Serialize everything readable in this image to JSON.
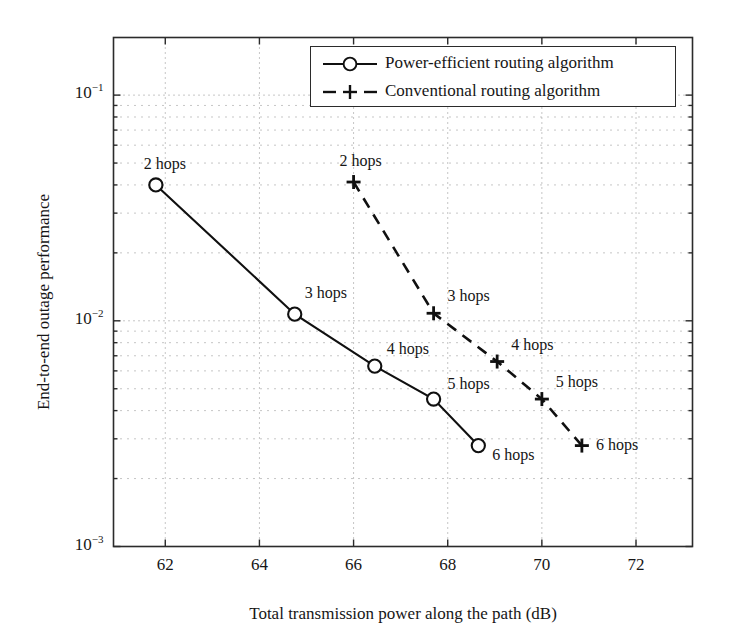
{
  "chart_data": {
    "type": "line",
    "title": "",
    "xlabel": "Total transmission power along the path (dB)",
    "ylabel": "End-to-end outage performance",
    "xlim": [
      60.9,
      73.2
    ],
    "ylim": [
      0.001,
      0.18
    ],
    "yscale": "log",
    "xticks": [
      62,
      64,
      66,
      68,
      70,
      72
    ],
    "xticklabels": [
      "62",
      "64",
      "66",
      "68",
      "70",
      "72"
    ],
    "yticks": [
      0.001,
      0.01,
      0.1
    ],
    "yticklabels": [
      "10-3",
      "10-2",
      "10-1"
    ],
    "grid": "dotted-minor-and-major",
    "legend_position": "upper right",
    "series": [
      {
        "name": "Power-efficient routing algorithm",
        "marker": "circle",
        "linestyle": "solid",
        "color": "#101010",
        "x": [
          61.8,
          64.75,
          66.45,
          67.7,
          68.65
        ],
        "y": [
          0.04,
          0.0107,
          0.0063,
          0.0045,
          0.0028
        ],
        "point_labels": [
          "2 hops",
          "3 hops",
          "4 hops",
          "5 hops",
          "6 hops"
        ]
      },
      {
        "name": "Conventional routing algorithm",
        "marker": "plus",
        "linestyle": "dashed",
        "color": "#101010",
        "x": [
          66.0,
          67.7,
          69.05,
          70.0,
          70.85
        ],
        "y": [
          0.0412,
          0.0108,
          0.0066,
          0.0045,
          0.0028
        ],
        "point_labels": [
          "2 hops",
          "3 hops",
          "4 hops",
          "5 hops",
          "6 hops"
        ]
      }
    ]
  },
  "legend": {
    "entries": [
      {
        "label": "Power-efficient routing algorithm",
        "marker": "circle-marker",
        "style": "solid-line"
      },
      {
        "label": "Conventional routing algorithm",
        "marker": "plus-marker",
        "style": "dashed-line"
      }
    ]
  },
  "axes": {
    "x_title": "Total transmission power along the path (dB)",
    "y_title": "End-to-end outage performance",
    "x_tick_labels": [
      "62",
      "64",
      "66",
      "68",
      "70",
      "72"
    ],
    "y_tick_labels": [
      {
        "base": "10",
        "exp": "−3"
      },
      {
        "base": "10",
        "exp": "−2"
      },
      {
        "base": "10",
        "exp": "−1"
      }
    ]
  },
  "annotations": {
    "solid": [
      "2 hops",
      "3 hops",
      "4 hops",
      "5 hops",
      "6 hops"
    ],
    "dashed": [
      "2 hops",
      "3 hops",
      "4 hops",
      "5 hops",
      "6 hops"
    ]
  },
  "colors": {
    "line": "#101010",
    "frame": "#2b2b2b",
    "grid": "#8c8c8c",
    "background": "#ffffff",
    "text": "#161616"
  }
}
